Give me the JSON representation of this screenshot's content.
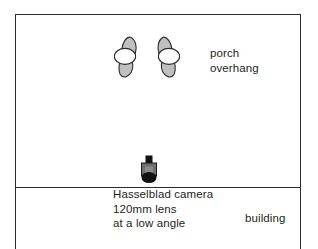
{
  "diagram": {
    "type": "floor-plan-sketch",
    "colors": {
      "stroke": "#2b2b2b",
      "text": "#231f20",
      "footprint_fill": "#bfbfbf",
      "footprint_highlight": "#ffffff",
      "camera_body": "#6f6f6f",
      "camera_top": "#111111",
      "background": "#ffffff"
    },
    "annotations": {
      "porch_overhang": {
        "lines": [
          "porch",
          "overhang"
        ],
        "line1": "porch",
        "line2": "overhang"
      },
      "camera_notes": {
        "lines": [
          "Hasselblad camera",
          "120mm lens",
          "at a low angle"
        ],
        "line1": "Hasselblad camera",
        "line2": "120mm lens",
        "line3": "at a low angle"
      },
      "building": {
        "text": "building"
      }
    },
    "icons": {
      "footprint_left": "footprint-icon",
      "footprint_right": "footprint-icon",
      "camera": "camera-icon"
    }
  }
}
